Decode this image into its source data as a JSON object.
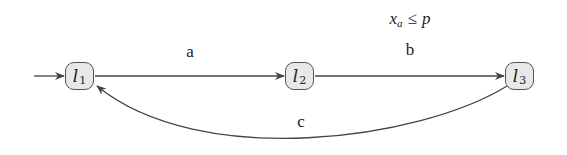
{
  "diagram": {
    "type": "timed-automaton",
    "colors": {
      "edge": "#444444",
      "node_fill": "#e8e8e8",
      "node_border": "#555555",
      "text": "#222222"
    },
    "nodes": [
      {
        "id": "l1",
        "base": "l",
        "sub": "1",
        "initial": true
      },
      {
        "id": "l2",
        "base": "l",
        "sub": "2",
        "initial": false
      },
      {
        "id": "l3",
        "base": "l",
        "sub": "3",
        "initial": false
      }
    ],
    "edges": [
      {
        "from": "l1",
        "to": "l2",
        "label": "a",
        "guard": ""
      },
      {
        "from": "l2",
        "to": "l3",
        "label": "b",
        "guard": "x_a ≤ p"
      },
      {
        "from": "l3",
        "to": "l1",
        "label": "c",
        "guard": "",
        "curved": true
      }
    ],
    "guard_b": {
      "var": "x",
      "var_sub": "a",
      "op": "≤",
      "rhs": "p"
    }
  }
}
